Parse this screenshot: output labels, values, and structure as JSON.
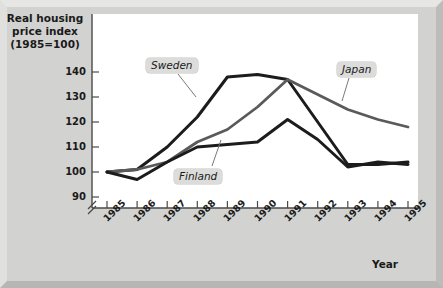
{
  "figure": {
    "background_color": "#d2d2d0",
    "plot_background_color": "#ffffff"
  },
  "axis_titles": {
    "y": "Real housing\nprice index\n(1985=100)",
    "x": "Year"
  },
  "chart_data": {
    "type": "line",
    "title": "Real housing price index (1985=100)",
    "xlabel": "Year",
    "ylabel": "Real housing price index (1985=100)",
    "x": [
      "1985",
      "1986",
      "1987",
      "1988",
      "1989",
      "1990",
      "1991",
      "1992",
      "1993",
      "1994",
      "1995"
    ],
    "xticklabels": [
      "1985",
      "1986",
      "1987",
      "1988",
      "1989",
      "1990",
      "1991",
      "1992",
      "1993",
      "1994",
      "1995"
    ],
    "yticklabels": [
      "90",
      "100",
      "110",
      "120",
      "130",
      "140"
    ],
    "ylim": [
      85,
      145
    ],
    "ytick_values": [
      90,
      100,
      110,
      120,
      130,
      140
    ],
    "axis_break": true,
    "grid": false,
    "legend": "inline-annotations",
    "series": [
      {
        "name": "Sweden",
        "color": "#1c1c1c",
        "width": 3.0,
        "values": [
          100,
          101,
          110,
          122,
          138,
          139,
          137,
          120,
          103,
          103,
          104
        ],
        "label_position": {
          "x": 146,
          "y": 58
        },
        "leader_line": {
          "x1": 178,
          "y1": 74,
          "x2": 196,
          "y2": 97
        }
      },
      {
        "name": "Japan",
        "color": "#5a5a5a",
        "width": 2.8,
        "values": [
          100,
          101,
          104,
          112,
          117,
          126,
          137,
          131,
          125,
          121,
          118
        ],
        "label_position": {
          "x": 337,
          "y": 62
        },
        "leader_line": {
          "x1": 349,
          "y1": 78,
          "x2": 342,
          "y2": 101
        }
      },
      {
        "name": "Finland",
        "color": "#1c1c1c",
        "width": 3.0,
        "values": [
          100,
          97,
          104,
          110,
          111,
          112,
          121,
          113,
          102,
          104,
          103
        ],
        "label_position": {
          "x": 174,
          "y": 169
        },
        "leader_line": {
          "x1": 212,
          "y1": 166,
          "x2": 221,
          "y2": 140
        }
      }
    ]
  },
  "icons": {
    "axis_break": "axis-break-icon"
  }
}
